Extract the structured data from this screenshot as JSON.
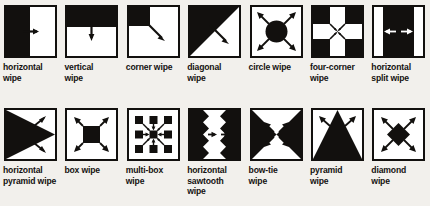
{
  "figure": {
    "background_color": "#f2f0ec",
    "ink_color": "#12100e",
    "rows": 2,
    "columns": 7
  },
  "items": [
    {
      "id": "horizontal-wipe",
      "icon": "horizontal-wipe-icon",
      "lines": [
        "horizontal",
        "wipe"
      ]
    },
    {
      "id": "vertical-wipe",
      "icon": "vertical-wipe-icon",
      "lines": [
        "vertical",
        "wipe"
      ]
    },
    {
      "id": "corner-wipe",
      "icon": "corner-wipe-icon",
      "lines": [
        "corner wipe"
      ]
    },
    {
      "id": "diagonal-wipe",
      "icon": "diagonal-wipe-icon",
      "lines": [
        "diagonal",
        "wipe"
      ]
    },
    {
      "id": "circle-wipe",
      "icon": "circle-wipe-icon",
      "lines": [
        "circle wipe"
      ]
    },
    {
      "id": "four-corner-wipe",
      "icon": "four-corner-wipe-icon",
      "lines": [
        "four-corner",
        "wipe"
      ]
    },
    {
      "id": "horizontal-split-wipe",
      "icon": "horizontal-split-wipe-icon",
      "lines": [
        "horizontal",
        "split wipe"
      ]
    },
    {
      "id": "horizontal-pyramid-wipe",
      "icon": "horizontal-pyramid-wipe-icon",
      "lines": [
        "horizontal",
        "pyramid wipe"
      ]
    },
    {
      "id": "box-wipe",
      "icon": "box-wipe-icon",
      "lines": [
        "box wipe"
      ]
    },
    {
      "id": "multi-box-wipe",
      "icon": "multi-box-wipe-icon",
      "lines": [
        "multi-box",
        "wipe"
      ]
    },
    {
      "id": "horizontal-sawtooth-wipe",
      "icon": "horizontal-sawtooth-wipe-icon",
      "lines": [
        "horizontal",
        "sawtooth",
        "wipe"
      ]
    },
    {
      "id": "bow-tie-wipe",
      "icon": "bow-tie-wipe-icon",
      "lines": [
        "bow-tie",
        "wipe"
      ]
    },
    {
      "id": "pyramid-wipe",
      "icon": "pyramid-wipe-icon",
      "lines": [
        "pyramid",
        "wipe"
      ]
    },
    {
      "id": "diamond-wipe",
      "icon": "diamond-wipe-icon",
      "lines": [
        "diamond",
        "wipe"
      ]
    }
  ]
}
